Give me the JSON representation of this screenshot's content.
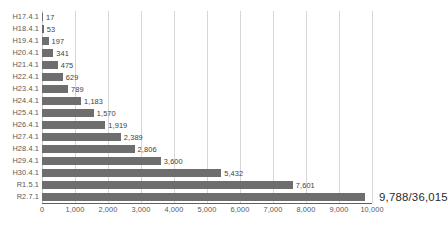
{
  "chart_data": {
    "type": "bar",
    "orientation": "horizontal",
    "title": "",
    "subtitle": "",
    "xlabel": "",
    "ylabel": "",
    "xlim": [
      0,
      10000
    ],
    "grid": true,
    "legend": false,
    "legend_position": "none",
    "xticks": [
      0,
      1000,
      2000,
      3000,
      4000,
      5000,
      6000,
      7000,
      8000,
      9000,
      10000
    ],
    "xtick_labels": [
      "0",
      "1,000",
      "2,000",
      "3,000",
      "4,000",
      "5,000",
      "6,000",
      "7,000",
      "8,000",
      "9,000",
      "10,000"
    ],
    "categories": [
      "H17.4.1",
      "H18.4.1",
      "H19.4.1",
      "H20.4.1",
      "H21.4.1",
      "H22.4.1",
      "H23.4.1",
      "H24.4.1",
      "H25.4.1",
      "H26.4.1",
      "H27.4.1",
      "H28.4.1",
      "H29.4.1",
      "H30.4.1",
      "R1.5.1",
      "R2.7.1"
    ],
    "values": [
      17,
      53,
      197,
      341,
      475,
      629,
      789,
      1183,
      1570,
      1919,
      2389,
      2806,
      3600,
      5432,
      7601,
      9788
    ],
    "data_labels": [
      "17",
      "53",
      "197",
      "341",
      "475",
      "629",
      "789",
      "1,183",
      "1,570",
      "1,919",
      "2,389",
      "2,806",
      "3,600",
      "5,432",
      "7,601",
      "9,788/36,015"
    ],
    "highlight_index": 15,
    "bar_color": "#6e6e6e",
    "grid_color": "#d6d6d6",
    "axis_color": "#5f5f5f",
    "label_color": "#5a5a5a",
    "value_color": "#3d3d3d"
  }
}
